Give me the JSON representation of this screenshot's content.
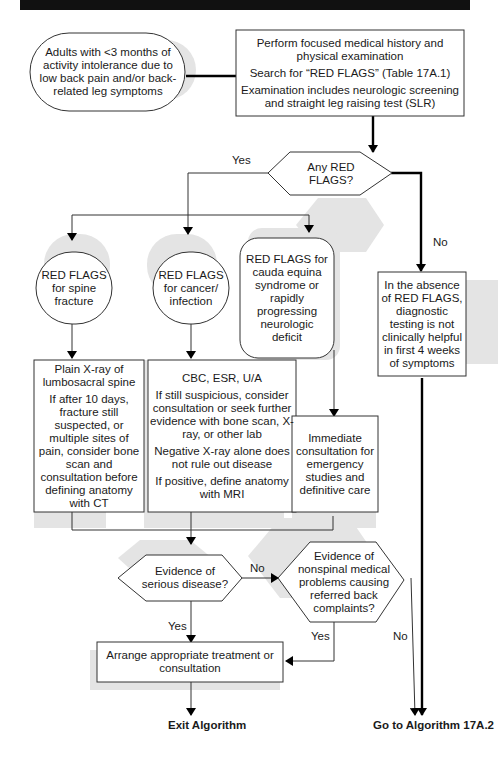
{
  "diagram": {
    "start": "Adults with <3 months of activity intolerance due to low back pain and/or back-related leg symptoms",
    "exam": [
      "Perform focused medical history and physical examination",
      "Search for “RED FLAGS” (Table 17A.1)",
      "Examination includes neurologic screening and straight leg raising test (SLR)"
    ],
    "decision_red_flags": "Any RED FLAGS?",
    "branch_yes": "Yes",
    "branch_no": "No",
    "red_flags_fracture": "RED FLAGS for spine fracture",
    "red_flags_cancer": "RED FLAGS for cancer/ infection",
    "red_flags_cauda": "RED FLAGS for cauda equina syndrome or rapidly progressing neurologic deficit",
    "no_red_flags": "In the absence of RED FLAGS, diagnostic testing is not clinically helpful in first 4 weeks of symptoms",
    "fracture_workup": [
      "Plain X-ray of lumbosacral spine",
      "If after 10 days, fracture still suspected, or multiple sites of pain, consider bone scan and consultation before defining anatomy with CT"
    ],
    "cancer_workup": [
      "CBC, ESR, U/A",
      "If still suspicious, consider consultation or seek further evidence with bone scan, X-ray, or other lab",
      "Negative X-ray alone does not rule out disease",
      "If positive, define anatomy with MRI"
    ],
    "cauda_workup": "Immediate consultation for emergency studies and definitive care",
    "decision_serious": "Evidence of serious disease?",
    "decision_nonspinal": "Evidence of nonspinal medical problems causing referred back complaints?",
    "label_no_serious": "No",
    "label_yes_serious": "Yes",
    "label_yes_nonspinal": "Yes",
    "label_no_nonspinal": "No",
    "treatment": "Arrange appropriate treatment or consultation",
    "exit": "Exit Algorithm",
    "goto": "Go to Algorithm 17A.2"
  }
}
